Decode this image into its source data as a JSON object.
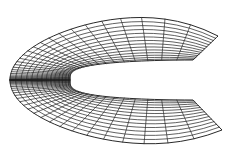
{
  "diagram": {
    "type": "structured-c-grid-mesh",
    "colors": {
      "background": "#ffffff",
      "line": "#1c1c1c"
    },
    "geometry": {
      "inner_nose_x": 70,
      "inner_center_y": 80,
      "inner_half_height": 20,
      "inner_right_x": 193,
      "outer_left_x": 10,
      "outer_top_y": 8,
      "outer_bottom_y": 152,
      "outer_right_top": [
        218,
        36
      ],
      "outer_right_bottom": [
        222,
        130
      ],
      "notch_vertex": [
        193,
        83
      ]
    },
    "mesh": {
      "radial_lines": 14,
      "wrap_lines": 60,
      "nose_clustering": 2.6,
      "radial_clustering": 1.35
    }
  }
}
